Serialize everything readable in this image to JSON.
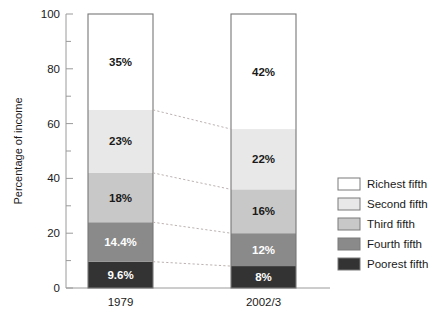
{
  "chart_data": {
    "type": "bar",
    "subtype": "stacked-bar-100",
    "title": "",
    "xlabel": "",
    "ylabel": "Percentage of income",
    "ylim": [
      0,
      100
    ],
    "grid": false,
    "legend_position": "right",
    "categories": [
      "1979",
      "2002/3"
    ],
    "ytick_labels": [
      "0",
      "20",
      "40",
      "60",
      "80",
      "100"
    ],
    "ytick_values": [
      0,
      20,
      40,
      60,
      80,
      100
    ],
    "yminor_tick_values": [
      10,
      30,
      50,
      70,
      90
    ],
    "series": [
      {
        "name": "Richest fifth",
        "color": "#ffffff",
        "values": [
          35,
          42
        ],
        "labels": [
          "35%",
          "42%"
        ]
      },
      {
        "name": "Second fifth",
        "color": "#e8e8e8",
        "values": [
          23,
          22
        ],
        "labels": [
          "23%",
          "22%"
        ]
      },
      {
        "name": "Third fifth",
        "color": "#c8c8c8",
        "values": [
          18,
          16
        ],
        "labels": [
          "18%",
          "16%"
        ]
      },
      {
        "name": "Fourth fifth",
        "color": "#8a8a8a",
        "values": [
          14.4,
          12
        ],
        "labels": [
          "14.4%",
          "12%"
        ]
      },
      {
        "name": "Poorest fifth",
        "color": "#333333",
        "values": [
          9.6,
          8
        ],
        "labels": [
          "9.6%",
          "8%"
        ]
      }
    ],
    "stack_order_bottom_to_top": [
      "Poorest fifth",
      "Fourth fifth",
      "Third fifth",
      "Second fifth",
      "Richest fifth"
    ],
    "connectors": [
      {
        "from_value": 65.0,
        "to_value": 58.0
      },
      {
        "from_value": 42.0,
        "to_value": 36.0
      },
      {
        "from_value": 24.0,
        "to_value": 20.0
      },
      {
        "from_value": 9.6,
        "to_value": 8.0
      }
    ],
    "annotations": []
  },
  "axis": {
    "ylabel": "Percentage of income"
  },
  "legend": {
    "items": [
      {
        "label": "Richest fifth",
        "color": "#ffffff"
      },
      {
        "label": "Second fifth",
        "color": "#e8e8e8"
      },
      {
        "label": "Third fifth",
        "color": "#c8c8c8"
      },
      {
        "label": "Fourth fifth",
        "color": "#8a8a8a"
      },
      {
        "label": "Poorest fifth",
        "color": "#333333"
      }
    ]
  }
}
